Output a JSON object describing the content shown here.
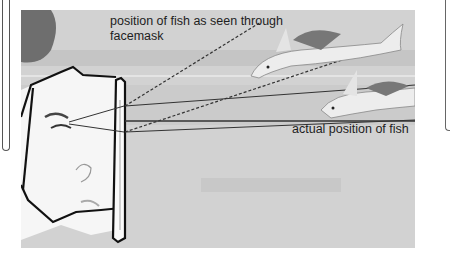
{
  "diagram": {
    "labels": {
      "apparent_position": "position of fish as seen through facemask",
      "actual_position": "actual position of fish"
    },
    "elements": [
      "diver-head-profile",
      "facemask",
      "apparent-fish",
      "actual-fish",
      "sight-lines",
      "dashed-projection-lines",
      "horizon-line"
    ],
    "colors": {
      "water": "#cfcfcf",
      "lines": "#2a2a2a",
      "fish": "#ececec",
      "fin_stripes": "#555555"
    }
  }
}
